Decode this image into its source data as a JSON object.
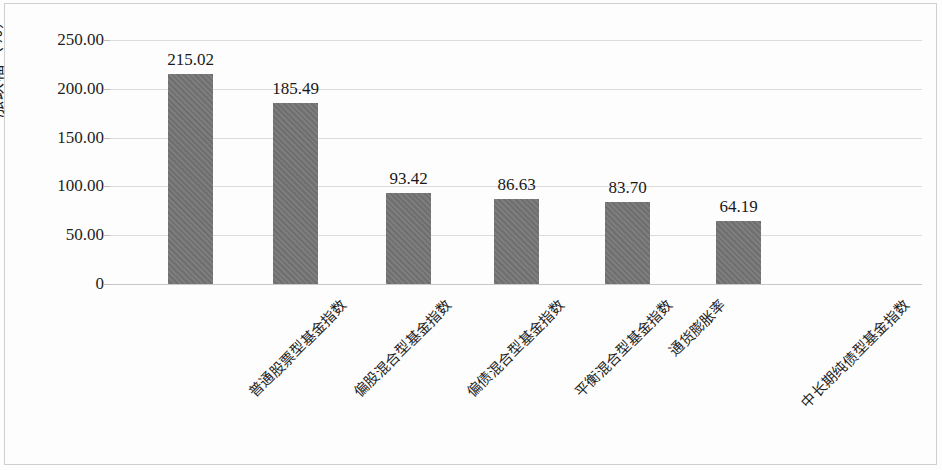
{
  "chart_data": {
    "type": "bar",
    "title": "",
    "subtitle": "",
    "xlabel": "",
    "ylabel": "涨跌幅（%）",
    "ylim": [
      0,
      250
    ],
    "ytick_labels": [
      "250.00",
      "200.00",
      "150.00",
      "100.00",
      "50.00",
      "0"
    ],
    "ytick_values": [
      250,
      200,
      150,
      100,
      50,
      0
    ],
    "grid": true,
    "legend": "none",
    "bar_color": "#757575",
    "gridline_color": "#dcdcdc",
    "categories": [
      "普通股票型基金指数",
      "偏股混合型基金指数",
      "偏债混合型基金指数",
      "平衡混合型基金指数",
      "通货膨胀率",
      "中长期纯债型基金指数"
    ],
    "values": [
      215.02,
      185.49,
      93.42,
      86.63,
      83.7,
      64.19
    ],
    "value_labels": [
      "215.02",
      "185.49",
      "93.42",
      "86.63",
      "83.70",
      "64.19"
    ]
  }
}
